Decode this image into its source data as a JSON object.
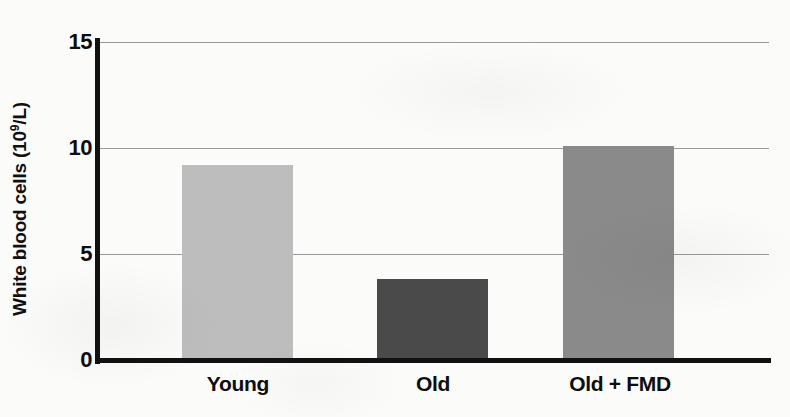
{
  "chart_data": {
    "type": "bar",
    "title": "",
    "xlabel": "",
    "ylabel": "White blood cells (10⁹/L)",
    "ylabel_base": "White blood cells (10",
    "ylabel_sup": "9",
    "ylabel_tail": "/L)",
    "categories": [
      "Young",
      "Old",
      "Old + FMD"
    ],
    "values": [
      9.2,
      3.8,
      10.1
    ],
    "series": [
      {
        "name": "White blood cells",
        "values": [
          9.2,
          3.8,
          10.1
        ],
        "colors": [
          "#bdbdbd",
          "#4a4a4a",
          "#8a8a8a"
        ]
      }
    ],
    "ylim": [
      0,
      15
    ],
    "yticks": [
      0,
      5,
      10,
      15
    ],
    "ytick_labels": [
      "0",
      "5",
      "10",
      "15"
    ],
    "grid": "horizontal",
    "legend": "none",
    "bar_colors": {
      "young": "#bdbdbd",
      "old": "#4a4a4a",
      "old_fmd": "#8a8a8a"
    },
    "axis_color": "#111111",
    "gridline_color": "#9a9a9a",
    "background": "#fbfbfa"
  }
}
